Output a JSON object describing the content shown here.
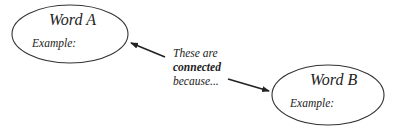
{
  "diagram": {
    "nodes": [
      {
        "id": "A",
        "title": "Word A",
        "example_label": "Example:"
      },
      {
        "id": "B",
        "title": "Word B",
        "example_label": "Example:"
      }
    ],
    "connector": {
      "line1": "These are",
      "line2": "connected",
      "line3": "because..."
    },
    "edges": [
      {
        "from": "connector",
        "to": "A"
      },
      {
        "from": "connector",
        "to": "B"
      }
    ],
    "colors": {
      "stroke": "#222222",
      "background": "#ffffff"
    }
  }
}
